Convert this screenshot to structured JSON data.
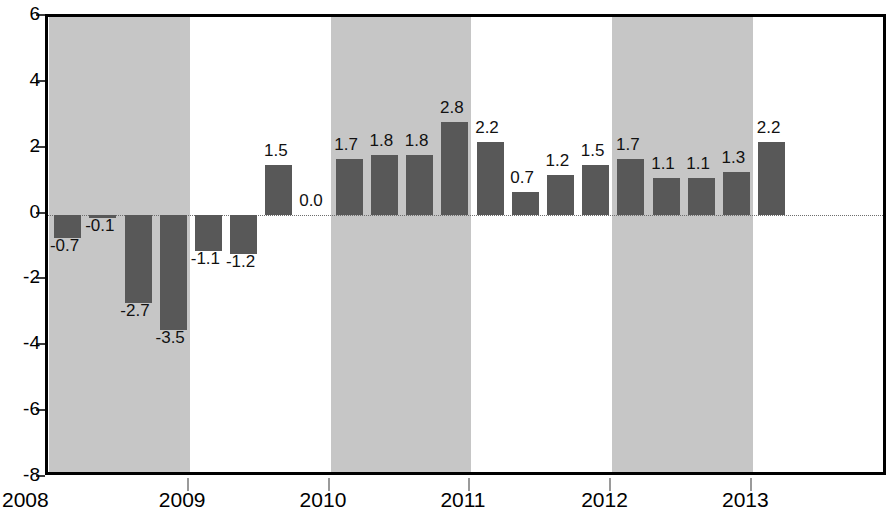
{
  "chart_data": {
    "type": "bar",
    "title": "",
    "subtitle": "",
    "xlabel": "",
    "ylabel": "",
    "ylim": [
      -8,
      6
    ],
    "yticks": [
      6,
      4,
      2,
      0,
      -2,
      -4,
      -6,
      -8
    ],
    "ytick_labels": [
      "6",
      "4",
      "2",
      "0",
      "-2",
      "-4",
      "-6",
      "-8"
    ],
    "xtick_labels": [
      "2008",
      "2009",
      "2010",
      "2011",
      "2012",
      "2013"
    ],
    "xtick_values": [
      2008,
      2009,
      2010,
      2011,
      2012,
      2013
    ],
    "grid": false,
    "legend": null,
    "zero_line": 0,
    "bar_color": "#585858",
    "band_color": "#c6c6c6",
    "axis_color": "#000000",
    "label_color": "#111111",
    "shaded_years": [
      2008,
      2010,
      2012
    ],
    "categories": [
      "2008 Q1",
      "2008 Q2",
      "2008 Q3",
      "2008 Q4",
      "2009 Q1",
      "2009 Q2",
      "2009 Q3",
      "2009 Q4",
      "2010 Q1",
      "2010 Q2",
      "2010 Q3",
      "2010 Q4",
      "2011 Q1",
      "2011 Q2",
      "2011 Q3",
      "2011 Q4",
      "2012 Q1",
      "2012 Q2",
      "2012 Q3",
      "2012 Q4",
      "2013 Q1"
    ],
    "values": [
      -0.7,
      -0.1,
      -2.7,
      -3.5,
      -1.1,
      -1.2,
      1.5,
      0.0,
      1.7,
      1.8,
      1.8,
      2.8,
      2.2,
      0.7,
      1.2,
      1.5,
      1.7,
      1.1,
      1.1,
      1.3,
      2.2
    ],
    "data_labels": [
      "-0.7",
      "-0.1",
      "-2.7",
      "-3.5",
      "-1.1",
      "-1.2",
      "1.5",
      "0.0",
      "1.7",
      "1.8",
      "1.8",
      "2.8",
      "2.2",
      "0.7",
      "1.2",
      "1.5",
      "1.7",
      "1.1",
      "1.1",
      "1.3",
      "2.2"
    ]
  }
}
